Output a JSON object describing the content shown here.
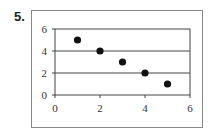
{
  "question_number": "5.",
  "chart_data": {
    "type": "scatter",
    "title": "",
    "xlabel": "",
    "ylabel": "",
    "x": [
      1,
      2,
      3,
      4,
      5
    ],
    "y": [
      5,
      4,
      3,
      2,
      1
    ],
    "points": [
      [
        1,
        5
      ],
      [
        2,
        4
      ],
      [
        3,
        3
      ],
      [
        4,
        2
      ],
      [
        5,
        1
      ]
    ],
    "xlim": [
      0,
      6
    ],
    "ylim": [
      0,
      6
    ],
    "x_ticks": [
      0,
      2,
      4,
      6
    ],
    "y_ticks": [
      0,
      2,
      4,
      6
    ],
    "grid": "horizontal at y ticks",
    "legend": null,
    "marker_color": "#111111"
  }
}
